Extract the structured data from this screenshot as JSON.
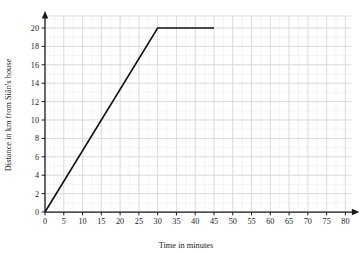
{
  "chart_data": {
    "type": "line",
    "title": "",
    "subtitle": "",
    "xlabel": "Time in minutes",
    "ylabel": "Distance  in km from Siân's house",
    "xlim": [
      0,
      80
    ],
    "ylim": [
      0,
      20
    ],
    "x_ticks": [
      0,
      5,
      10,
      15,
      20,
      25,
      30,
      35,
      40,
      45,
      50,
      55,
      60,
      65,
      70,
      75,
      80
    ],
    "y_ticks": [
      0,
      2,
      4,
      6,
      8,
      10,
      12,
      14,
      16,
      18,
      20
    ],
    "x_tick_labels": [
      "0",
      "5",
      "10",
      "15",
      "20",
      "25",
      "30",
      "35",
      "40",
      "45",
      "50",
      "55",
      "60",
      "65",
      "70",
      "75",
      "80"
    ],
    "y_tick_labels": [
      "0",
      "2",
      "4",
      "6",
      "8",
      "10",
      "12",
      "14",
      "16",
      "18",
      "20"
    ],
    "grid": true,
    "grid_minor": true,
    "legend": false,
    "legend_position": "none",
    "axis_arrows": true,
    "series": [
      {
        "name": "journey",
        "color": "#121212",
        "points": [
          {
            "x": 0,
            "y": 0
          },
          {
            "x": 30,
            "y": 20
          },
          {
            "x": 45,
            "y": 20
          }
        ]
      }
    ],
    "annotations": []
  },
  "colors": {
    "line": "#121212",
    "axis": "#1a1a1a",
    "grid_major": "#d8d8da",
    "grid_minor": "#ececed",
    "background": "#ffffff"
  }
}
